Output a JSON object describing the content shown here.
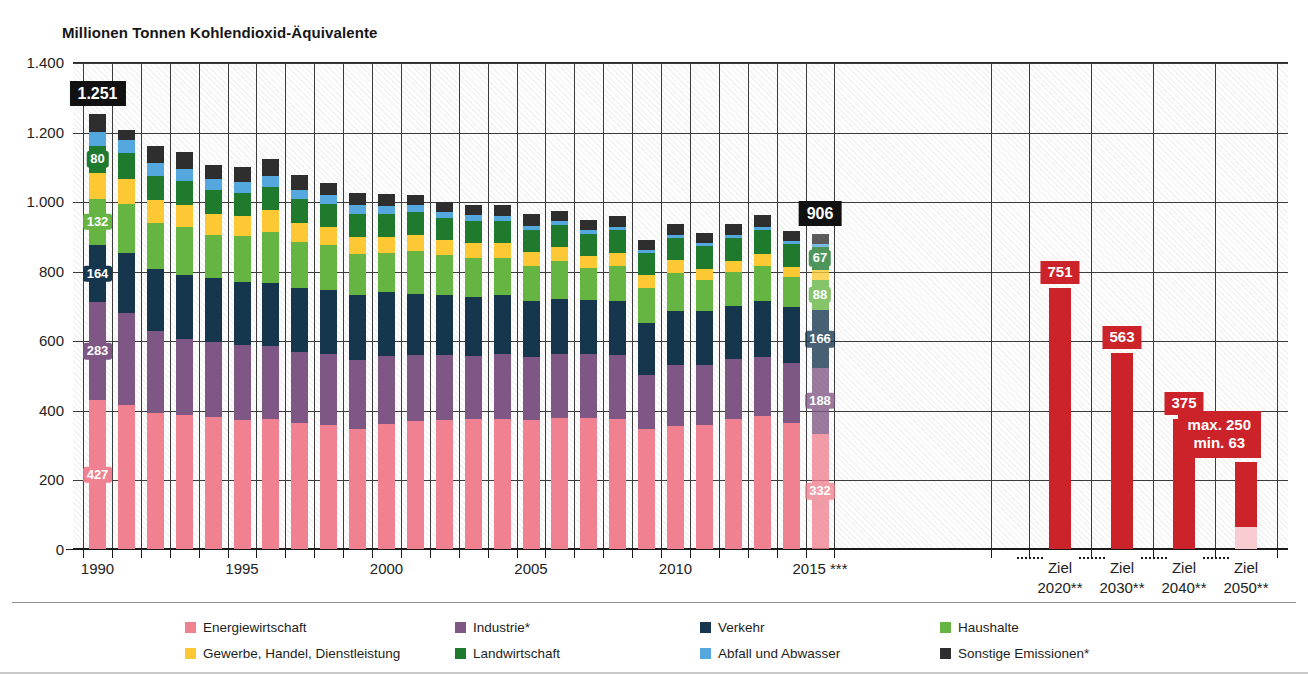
{
  "axis_title": "Millionen Tonnen Kohlendioxid-Äquivalente",
  "chart_data": {
    "type": "bar",
    "title": "Millionen Tonnen Kohlendioxid-Äquivalente",
    "xlabel": "",
    "ylabel": "Millionen Tonnen Kohlendioxid-Äquivalente",
    "ylim": [
      0,
      1400
    ],
    "yticks": [
      0,
      200,
      400,
      600,
      800,
      1000,
      1200,
      1400
    ],
    "ytick_labels": [
      "0",
      "200",
      "400",
      "600",
      "800",
      "1.000",
      "1.200",
      "1.400"
    ],
    "grid": true,
    "legend_position": "bottom",
    "stacked": true,
    "categories": [
      "1990",
      "1991",
      "1992",
      "1993",
      "1994",
      "1995",
      "1996",
      "1997",
      "1998",
      "1999",
      "2000",
      "2001",
      "2002",
      "2003",
      "2004",
      "2005",
      "2006",
      "2007",
      "2008",
      "2009",
      "2010",
      "2011",
      "2012",
      "2013",
      "2014",
      "2015"
    ],
    "xtick_labels": [
      "1990",
      "1995",
      "2000",
      "2005",
      "2010",
      "2015 ***"
    ],
    "series": [
      {
        "name": "Energiewirtschaft",
        "color": "#ef8190",
        "values": [
          427,
          415,
          391,
          384,
          379,
          372,
          374,
          361,
          357,
          345,
          359,
          368,
          372,
          374,
          374,
          370,
          377,
          377,
          374,
          344,
          355,
          357,
          375,
          383,
          363,
          332
        ]
      },
      {
        "name": "Industrie*",
        "color": "#7f5784",
        "values": [
          283,
          263,
          236,
          219,
          216,
          215,
          211,
          206,
          203,
          197,
          197,
          190,
          185,
          182,
          186,
          181,
          183,
          185,
          184,
          155,
          174,
          171,
          170,
          170,
          172,
          188
        ]
      },
      {
        "name": "Verkehr",
        "color": "#16364e",
        "values": [
          164,
          173,
          178,
          184,
          183,
          180,
          181,
          184,
          185,
          187,
          182,
          176,
          173,
          168,
          169,
          161,
          159,
          153,
          154,
          151,
          154,
          156,
          155,
          160,
          161,
          166
        ]
      },
      {
        "name": "Haushalte",
        "color": "#66b543",
        "values": [
          132,
          141,
          132,
          139,
          126,
          132,
          146,
          131,
          128,
          120,
          114,
          122,
          114,
          113,
          109,
          103,
          109,
          93,
          102,
          101,
          110,
          89,
          95,
          102,
          85,
          88
        ]
      },
      {
        "name": "Gewerbe, Handel, Dienstleistung",
        "color": "#fcc934",
        "values": [
          74,
          72,
          66,
          63,
          59,
          57,
          62,
          55,
          52,
          48,
          46,
          47,
          43,
          42,
          41,
          39,
          40,
          35,
          38,
          36,
          37,
          31,
          32,
          34,
          29,
          28
        ]
      },
      {
        "name": "Landwirtschaft",
        "color": "#1f7a2e",
        "values": [
          80,
          74,
          70,
          69,
          68,
          68,
          68,
          68,
          67,
          67,
          66,
          66,
          65,
          64,
          64,
          63,
          63,
          64,
          65,
          65,
          65,
          66,
          67,
          68,
          68,
          67
        ]
      },
      {
        "name": "Abfall und Abwasser",
        "color": "#55a8dd",
        "values": [
          38,
          37,
          36,
          34,
          33,
          32,
          30,
          28,
          26,
          24,
          22,
          20,
          18,
          16,
          15,
          13,
          12,
          11,
          10,
          9,
          9,
          9,
          8,
          8,
          8,
          8
        ]
      },
      {
        "name": "Sonstige Emissionen*",
        "color": "#2e2e2e",
        "values": [
          53,
          30,
          51,
          48,
          39,
          43,
          50,
          41,
          34,
          35,
          35,
          28,
          28,
          29,
          30,
          32,
          30,
          27,
          29,
          27,
          30,
          30,
          31,
          34,
          29,
          29
        ]
      }
    ],
    "totals": [
      1251,
      1205,
      1160,
      1140,
      1103,
      1099,
      1122,
      1074,
      1052,
      1023,
      1021,
      1017,
      998,
      988,
      988,
      962,
      973,
      945,
      956,
      888,
      934,
      909,
      933,
      959,
      915,
      906
    ],
    "value_labels_first_bar": {
      "year": "1990",
      "total": "1.251",
      "Energiewirtschaft": "427",
      "Industrie*": "283",
      "Verkehr": "164",
      "Haushalte": "132",
      "Landwirtschaft": "80"
    },
    "value_labels_last_bar": {
      "year": "2015",
      "total": "906",
      "Energiewirtschaft": "332",
      "Industrie*": "188",
      "Verkehr": "166",
      "Haushalte": "88",
      "Landwirtschaft": "67"
    },
    "goal_bars": [
      {
        "label_line1": "Ziel",
        "label_line2": "2020**",
        "value": 751,
        "value_label": "751",
        "color": "#cc2229"
      },
      {
        "label_line1": "Ziel",
        "label_line2": "2030**",
        "value": 563,
        "value_label": "563",
        "color": "#cc2229"
      },
      {
        "label_line1": "Ziel",
        "label_line2": "2040**",
        "value": 375,
        "value_label": "375",
        "color": "#cc2229"
      },
      {
        "label_line1": "Ziel",
        "label_line2": "2050**",
        "value_max": 250,
        "value_min": 63,
        "value_label_line1": "max. 250",
        "value_label_line2": "min. 63",
        "color": "#cc2229",
        "color_min": "#f9ccd2"
      }
    ]
  },
  "y_axis": {
    "labels": [
      "1.400",
      "1.200",
      "1.000",
      "800",
      "600",
      "400",
      "200",
      "0"
    ]
  },
  "x_axis": {
    "labels": [
      "1990",
      "1995",
      "2000",
      "2005",
      "2010",
      "2015 ***"
    ],
    "goal_labels": [
      {
        "l1": "Ziel",
        "l2": "2020**"
      },
      {
        "l1": "Ziel",
        "l2": "2030**"
      },
      {
        "l1": "Ziel",
        "l2": "2040**"
      },
      {
        "l1": "Ziel",
        "l2": "2050**"
      }
    ]
  },
  "labels": {
    "total_1990": "1.251",
    "total_2015": "906",
    "e_1990": "427",
    "i_1990": "283",
    "v_1990": "164",
    "h_1990": "132",
    "l_1990": "80",
    "e_2015": "332",
    "i_2015": "188",
    "v_2015": "166",
    "h_2015": "88",
    "l_2015": "67",
    "goal_2020": "751",
    "goal_2030": "563",
    "goal_2040": "375",
    "goal_2050_max": "max. 250",
    "goal_2050_min": "min. 63"
  },
  "legend": {
    "items": [
      {
        "label": "Energiewirtschaft",
        "color": "#ef8190"
      },
      {
        "label": "Industrie*",
        "color": "#7f5784"
      },
      {
        "label": "Verkehr",
        "color": "#16364e"
      },
      {
        "label": "Haushalte",
        "color": "#66b543"
      },
      {
        "label": "Gewerbe, Handel, Dienstleistung",
        "color": "#fcc934"
      },
      {
        "label": "Landwirtschaft",
        "color": "#1f7a2e"
      },
      {
        "label": "Abfall und Abwasser",
        "color": "#55a8dd"
      },
      {
        "label": "Sonstige Emissionen*",
        "color": "#2e2e2e"
      }
    ]
  }
}
